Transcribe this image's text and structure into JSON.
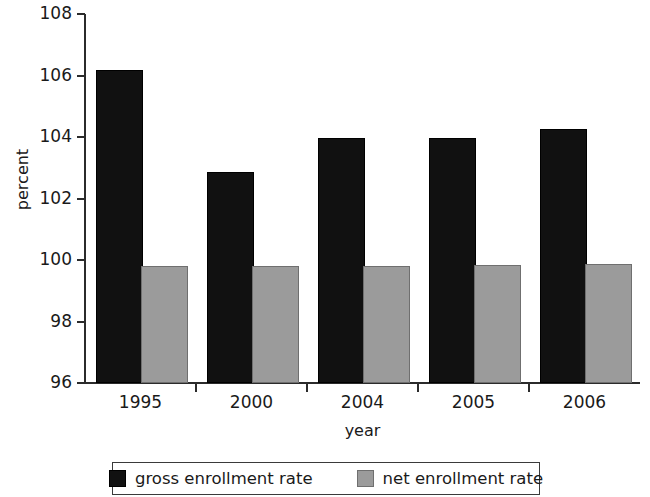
{
  "chart_data": {
    "type": "bar",
    "title": "",
    "subtitle": "",
    "xlabel": "year",
    "ylabel": "percent",
    "categories": [
      "1995",
      "2000",
      "2004",
      "2005",
      "2006"
    ],
    "series": [
      {
        "name": "gross enrollment rate",
        "color": "#111111",
        "values": [
          106.1,
          102.8,
          103.9,
          103.9,
          104.2
        ]
      },
      {
        "name": "net enrollment rate",
        "color": "#9b9b9b",
        "values": [
          99.75,
          99.75,
          99.75,
          99.78,
          99.8
        ]
      }
    ],
    "ylim": [
      96,
      108
    ],
    "yticks": [
      96,
      98,
      100,
      102,
      104,
      106,
      108
    ],
    "ytick_labels": [
      "96",
      "98",
      "100",
      "102",
      "104",
      "106",
      "108"
    ],
    "grid": false,
    "legend_position": "bottom",
    "legend_entries": [
      "gross enrollment rate",
      "net enrollment rate"
    ],
    "annotations": []
  }
}
